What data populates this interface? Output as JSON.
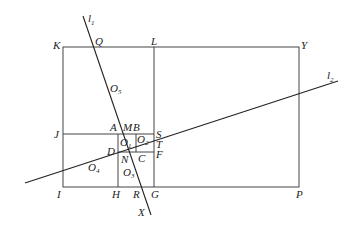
{
  "diagram": {
    "lines": [
      {
        "name": "l1",
        "label": "l",
        "sub": "1"
      },
      {
        "name": "l2",
        "label": "l",
        "sub": "2"
      }
    ],
    "points": {
      "K": "K",
      "Q": "Q",
      "L": "L",
      "Y": "Y",
      "J": "J",
      "A": "A",
      "M": "M",
      "B": "B",
      "S": "S",
      "T": "T",
      "F": "F",
      "D": "D",
      "N": "N",
      "C": "C",
      "I": "I",
      "H": "H",
      "R": "R",
      "G": "G",
      "P": "P",
      "X": "X"
    },
    "regions": [
      {
        "name": "O1",
        "label": "O",
        "sub": "1"
      },
      {
        "name": "O2",
        "label": "O",
        "sub": "2"
      },
      {
        "name": "O3",
        "label": "O",
        "sub": "3"
      },
      {
        "name": "O4",
        "label": "O",
        "sub": "4"
      },
      {
        "name": "O5",
        "label": "O",
        "sub": "5"
      }
    ]
  }
}
